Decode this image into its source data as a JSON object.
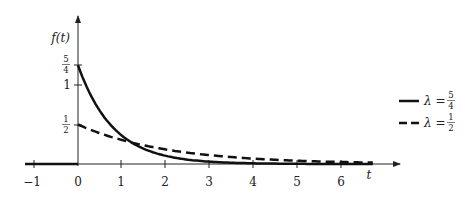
{
  "chart_data": {
    "type": "line",
    "title": "",
    "xlabel": "t",
    "ylabel": "f(t)",
    "xlim": [
      -1.2,
      7.3
    ],
    "ylim": [
      0,
      1.5
    ],
    "x_ticks": [
      "-1",
      "0",
      "1",
      "2",
      "3",
      "4",
      "5",
      "6"
    ],
    "y_ticks": [
      {
        "value": 1.25,
        "label_num": "5",
        "label_den": "4"
      },
      {
        "value": 1,
        "label": "1"
      },
      {
        "value": 0.5,
        "label_num": "1",
        "label_den": "2"
      }
    ],
    "grid": false,
    "legend_position": "right",
    "series": [
      {
        "name": "λ = 5/4",
        "lambda": 1.25,
        "style": "solid",
        "formula": "f(t) = λ e^{-λ t} for t ≥ 0, 0 for t < 0",
        "x": [
          0,
          0.5,
          1,
          1.5,
          2,
          3,
          4,
          5,
          6,
          6.7
        ],
        "values": [
          1.25,
          0.67,
          0.36,
          0.19,
          0.1,
          0.03,
          0.008,
          0.002,
          0.0007,
          0.0003
        ]
      },
      {
        "name": "λ = 1/2",
        "lambda": 0.5,
        "style": "dashed",
        "formula": "f(t) = λ e^{-λ t} for t ≥ 0, 0 for t < 0",
        "x": [
          0,
          0.5,
          1,
          1.5,
          2,
          3,
          4,
          5,
          6,
          6.7
        ],
        "values": [
          0.5,
          0.39,
          0.3,
          0.24,
          0.18,
          0.11,
          0.07,
          0.04,
          0.025,
          0.018
        ]
      }
    ]
  },
  "labels": {
    "ylabel": "f(t)",
    "xlabel": "t",
    "xticks": [
      "−1",
      "0",
      "1",
      "2",
      "3",
      "4",
      "5",
      "6"
    ],
    "yt_54_num": "5",
    "yt_54_den": "4",
    "yt_1": "1",
    "yt_12_num": "1",
    "yt_12_den": "2",
    "legend1_lambda": "λ = ",
    "legend1_num": "5",
    "legend1_den": "4",
    "legend2_lambda": "λ = ",
    "legend2_num": "1",
    "legend2_den": "2"
  }
}
